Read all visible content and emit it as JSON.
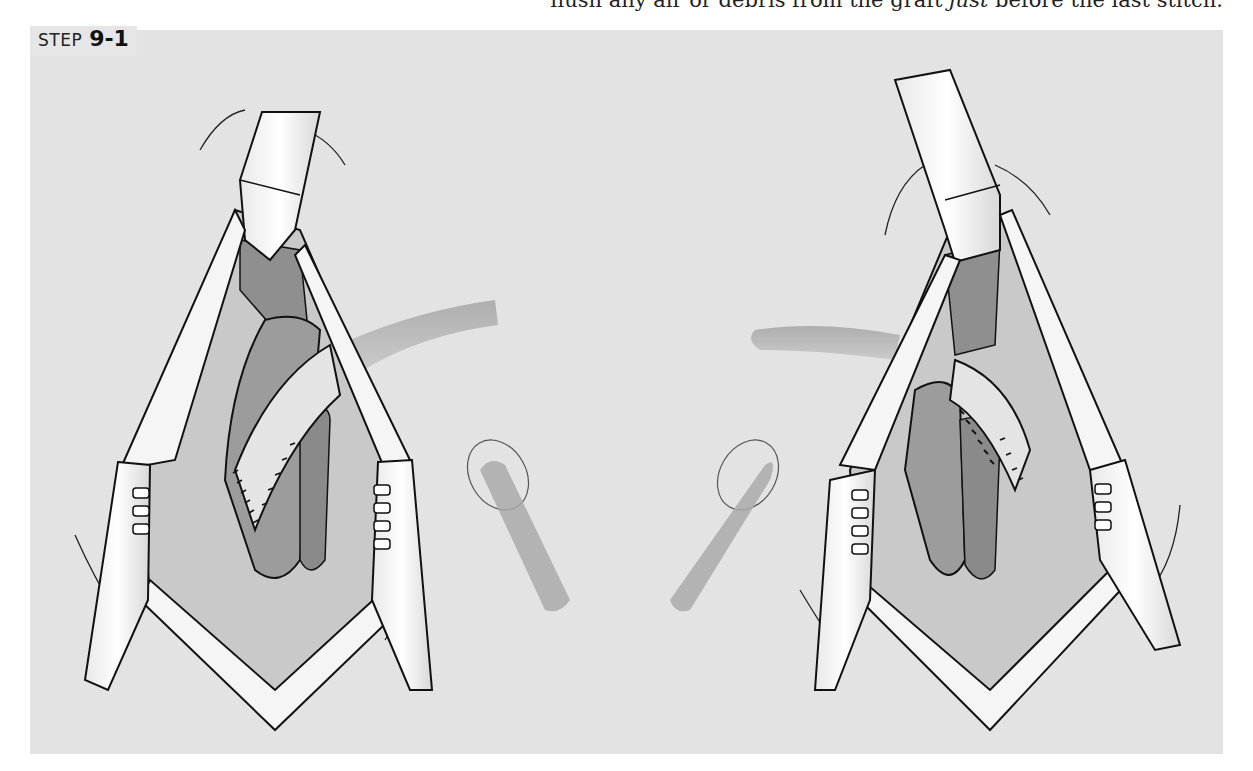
{
  "page": {
    "top_text": {
      "prefix": "flush any air or debris from the graft ",
      "emphasis": "just",
      "suffix": " before the last stitch."
    }
  },
  "figure": {
    "step_word": "STEP",
    "step_number": "9-1",
    "panels": [
      {
        "id": "left",
        "description": "Surgical exposure with retractors and sutured graft (view 1)"
      },
      {
        "id": "right",
        "description": "Surgical exposure with retractors and sutured graft (view 2)"
      }
    ],
    "colors": {
      "background": "#e3e3e3",
      "tissue_dark": "#9a9a9a",
      "tissue_mid": "#b8b8b8",
      "tissue_light": "#d2d2d2",
      "retractor": "#f2f2f2",
      "outline": "#111111"
    }
  }
}
